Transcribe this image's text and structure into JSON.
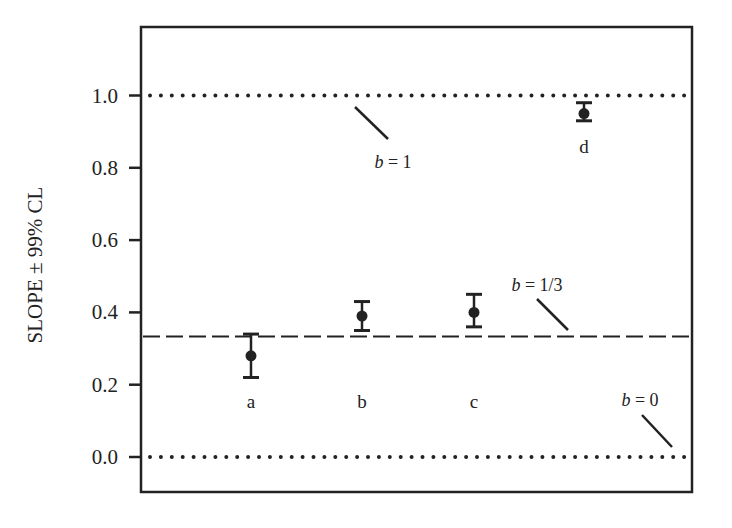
{
  "chart_data": {
    "type": "scatter",
    "title": "",
    "xlabel": "",
    "ylabel": "SLOPE ± 99% CL",
    "ylim": [
      -0.1,
      1.18
    ],
    "yticks": [
      0.0,
      0.2,
      0.4,
      0.6,
      0.8,
      1.0
    ],
    "ytick_labels": [
      "0.0",
      "0.2",
      "0.4",
      "0.6",
      "0.8",
      "1.0"
    ],
    "grid": false,
    "legend": null,
    "series": [
      {
        "name": "slope estimates",
        "points": [
          {
            "label": "a",
            "value": 0.28,
            "lower": 0.22,
            "upper": 0.34
          },
          {
            "label": "b",
            "value": 0.39,
            "lower": 0.35,
            "upper": 0.43
          },
          {
            "label": "c",
            "value": 0.4,
            "lower": 0.36,
            "upper": 0.45
          },
          {
            "label": "d",
            "value": 0.95,
            "lower": 0.93,
            "upper": 0.98
          }
        ]
      }
    ],
    "reference_lines": [
      {
        "value": 1.0,
        "style": "dotted",
        "label_prefix": "b",
        "label_suffix": " = 1"
      },
      {
        "value": 0.3333,
        "style": "dashed",
        "label_prefix": "b",
        "label_suffix": " = 1/3"
      },
      {
        "value": 0.0,
        "style": "dotted",
        "label_prefix": "b",
        "label_suffix": " = 0"
      }
    ]
  },
  "colors": {
    "ink": "#222222",
    "background": "#ffffff"
  }
}
